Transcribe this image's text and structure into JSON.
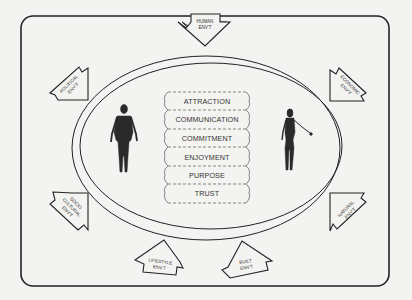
{
  "diagram": {
    "type": "conceptual-model",
    "relationship_factors": [
      "ATTRACTION",
      "COMMUNICATION",
      "COMMITMENT",
      "ENJOYMENT",
      "PURPOSE",
      "TRUST"
    ],
    "environments": {
      "human": [
        "HUMAN",
        "ENV'T"
      ],
      "economic": [
        "ECONOMIC",
        "ENV'T"
      ],
      "natural": [
        "NATURAL",
        "ENV'T"
      ],
      "built": [
        "BUILT",
        "ENV'T"
      ],
      "lifestyle": [
        "LIFESTYLE",
        "ENV'T"
      ],
      "socio_cultural": [
        "SOCIO",
        "CULTURAL",
        "ENV'T"
      ],
      "political": [
        "POLITICAL",
        "ENV'T"
      ]
    },
    "figures": [
      "male-figure",
      "female-figure"
    ],
    "colors": {
      "background": "#f3f3f1",
      "stroke": "#222222",
      "text": "#333333"
    }
  }
}
